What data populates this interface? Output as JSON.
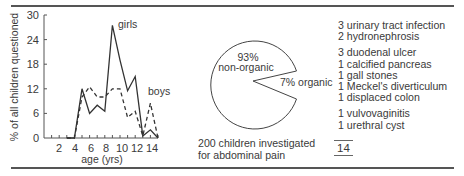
{
  "chart_data": [
    {
      "type": "line",
      "title": "",
      "xlabel": "age (yrs)",
      "ylabel": "% of all children questioned",
      "x": [
        3,
        4,
        5,
        6,
        7,
        8,
        9,
        10,
        11,
        12,
        13,
        14,
        15
      ],
      "xticks": [
        2,
        4,
        6,
        8,
        10,
        12,
        14
      ],
      "yticks": [
        0,
        6,
        12,
        18,
        24,
        30
      ],
      "ylim": [
        0,
        30
      ],
      "xlim": [
        0,
        15
      ],
      "grid": false,
      "series": [
        {
          "name": "girls",
          "style": "solid",
          "values": [
            0,
            0,
            12,
            6,
            8,
            6.5,
            27.5,
            19,
            11.5,
            15,
            0.5,
            2,
            0
          ]
        },
        {
          "name": "boys",
          "style": "dashed",
          "values": [
            0,
            0,
            10,
            12.5,
            10,
            10,
            12,
            12,
            5,
            6.5,
            0.5,
            8.5,
            0
          ]
        }
      ],
      "annotations": [
        "girls",
        "boys"
      ]
    },
    {
      "type": "pie",
      "title": "200 children investigated for abdominal pain",
      "categories": [
        "non-organic",
        "organic"
      ],
      "values": [
        93,
        7
      ],
      "labels": [
        "93%\nnon-organic",
        "7% organic"
      ]
    }
  ],
  "line_chart": {
    "ylabel": "% of all children questioned",
    "xlabel": "age (yrs)",
    "ytick_labels": [
      "0",
      "6",
      "12",
      "18",
      "24",
      "30"
    ],
    "xtick_labels": [
      "2",
      "4",
      "6",
      "8",
      "10",
      "12",
      "14"
    ],
    "girls_label": "girls",
    "boys_label": "boys"
  },
  "pie_chart": {
    "big_pct": "93%",
    "big_label": "non-organic",
    "small_label": "7% organic",
    "caption_line1": "200 children investigated",
    "caption_line2": "for abdominal pain"
  },
  "organic_causes": {
    "groups": [
      [
        "3 urinary tract infection",
        "2 hydronephrosis"
      ],
      [
        "3 duodenal ulcer",
        "1 calcified pancreas",
        "1 gall stones",
        "1 Meckel's diverticulum",
        "1 displaced colon"
      ],
      [
        "1 vulvovaginitis",
        "1 urethral cyst"
      ]
    ],
    "total": "14"
  }
}
